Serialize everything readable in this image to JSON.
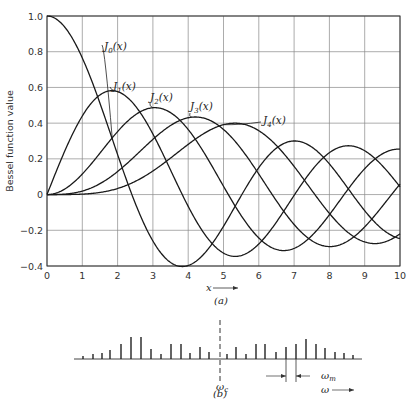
{
  "chart_data": [
    {
      "type": "line",
      "panel_label": "(a)",
      "title": "",
      "xlabel": "x",
      "ylabel": "Bessel function value",
      "xlim": [
        0,
        10
      ],
      "ylim": [
        -0.4,
        1.0
      ],
      "grid": true,
      "x_ticks": [
        "0",
        "1",
        "2",
        "3",
        "4",
        "5",
        "6",
        "7",
        "8",
        "9",
        "10"
      ],
      "y_ticks": [
        "1.0",
        "0.8",
        "0.6",
        "0.4",
        "0.2",
        "0",
        "-0.2",
        "-0.4"
      ],
      "x": [
        0,
        1,
        2,
        3,
        4,
        5,
        6,
        7,
        8,
        9,
        10
      ],
      "series": [
        {
          "name": "J0(x)",
          "label_sub": "0",
          "values": [
            1.0,
            0.765,
            0.224,
            -0.26,
            -0.397,
            -0.178,
            0.151,
            0.3,
            0.172,
            -0.09,
            -0.246
          ]
        },
        {
          "name": "J1(x)",
          "label_sub": "1",
          "values": [
            0.0,
            0.44,
            0.577,
            0.339,
            -0.066,
            -0.328,
            -0.277,
            -0.005,
            0.235,
            0.245,
            0.043
          ]
        },
        {
          "name": "J2(x)",
          "label_sub": "2",
          "values": [
            0.0,
            0.115,
            0.353,
            0.486,
            0.364,
            0.047,
            -0.243,
            -0.301,
            -0.113,
            0.145,
            0.255
          ]
        },
        {
          "name": "J3(x)",
          "label_sub": "3",
          "values": [
            0.0,
            0.02,
            0.129,
            0.309,
            0.43,
            0.365,
            0.115,
            -0.168,
            -0.291,
            -0.181,
            0.058
          ]
        },
        {
          "name": "J4(x)",
          "label_sub": "4",
          "values": [
            0.0,
            0.002,
            0.034,
            0.132,
            0.281,
            0.391,
            0.358,
            0.158,
            -0.105,
            -0.265,
            -0.22
          ]
        }
      ],
      "annotations": [
        {
          "text": "J0(x)",
          "at_x": 1.8
        },
        {
          "text": "J1(x)",
          "at_x": 1.9
        },
        {
          "text": "J2(x)",
          "at_x": 3.0
        },
        {
          "text": "J3(x)",
          "at_x": 4.1
        },
        {
          "text": "J4(x)",
          "at_x": 5.0
        }
      ],
      "x_arrow_label": "x"
    },
    {
      "type": "bar",
      "panel_label": "(b)",
      "title": "",
      "description": "Line spectrum of FM signal around carrier",
      "center_label": "ωc",
      "spacing_label": "ωm",
      "axis_label": "ω",
      "line_offsets": [
        -13,
        -12,
        -11,
        -10,
        -9,
        -8,
        -7,
        -6,
        -5,
        -4,
        -3,
        -2,
        -1,
        0,
        1,
        2,
        3,
        4,
        5,
        6,
        7,
        8,
        9,
        10,
        11,
        12,
        13
      ],
      "relative_heights": [
        0.12,
        0.2,
        0.25,
        0.38,
        0.6,
        0.95,
        0.95,
        0.4,
        0.22,
        0.6,
        0.6,
        0.25,
        0.5,
        0.3,
        0.22,
        0.5,
        0.22,
        0.6,
        0.6,
        0.3,
        0.5,
        0.6,
        0.85,
        0.6,
        0.5,
        0.3,
        0.25,
        0.15
      ]
    }
  ],
  "labels": {
    "ylabel": "Bessel function value",
    "panel_a": "(a)",
    "panel_b": "(b)",
    "x_axis": "x",
    "omega_c": "ω",
    "omega_c_sub": "c",
    "omega_m": "ω",
    "omega_m_sub": "m",
    "omega": "ω"
  }
}
